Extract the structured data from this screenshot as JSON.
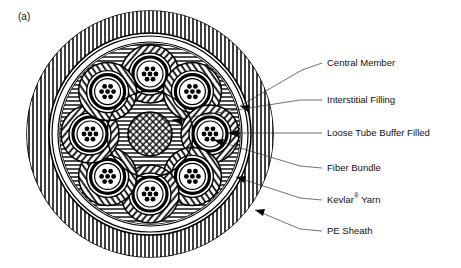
{
  "figure": {
    "tag": "(a)",
    "tag_x": 18,
    "tag_y": 17
  },
  "colors": {
    "line": "#000000",
    "leader": "#333333",
    "text": "#111111",
    "background": "#ffffff"
  },
  "cable": {
    "center_x": 150,
    "center_y": 134,
    "sheath_outer_r": 123,
    "sheath_inner_r": 101,
    "kevlar_outer_r": 98,
    "kevlar_inner_r": 92,
    "core_boundary_r": 90,
    "interstitial_r": 43,
    "central_member_r": 22,
    "tube_count": 8,
    "tube_orbit_r": 60,
    "tube_outer_r": 29,
    "tube_white_r": 21,
    "tube_black_r": 17,
    "bundle_r": 13,
    "fiber_dot_count": 7,
    "fiber_dot_r": 2.4,
    "fiber_ring_r": 6
  },
  "labels": [
    {
      "id": "central-member",
      "text": "Central Member",
      "text_x": 327,
      "text_y": 63,
      "leader": [
        [
          322,
          63
        ],
        [
          302,
          70
        ],
        [
          240,
          106
        ]
      ],
      "arrow_at": [
        240,
        106
      ],
      "arrow_angle": 150
    },
    {
      "id": "interstitial-filling",
      "text": "Interstitial Filling",
      "text_x": 327,
      "text_y": 100,
      "leader": [
        [
          322,
          100
        ],
        [
          300,
          100
        ],
        [
          172,
          120
        ]
      ],
      "arrow_at": [
        172,
        120
      ],
      "arrow_angle": 171
    },
    {
      "id": "loose-tube-buffer-filled",
      "text": "Loose Tube Buffer Filled",
      "text_x": 327,
      "text_y": 133,
      "leader": [
        [
          322,
          133
        ],
        [
          228,
          133
        ]
      ],
      "arrow_at": [
        228,
        133
      ],
      "arrow_angle": 180
    },
    {
      "id": "fiber-bundle",
      "text": "Fiber Bundle",
      "text_x": 327,
      "text_y": 168,
      "leader": [
        [
          322,
          168
        ],
        [
          300,
          166
        ],
        [
          214,
          140
        ]
      ],
      "arrow_at": [
        214,
        140
      ],
      "arrow_angle": 197
    },
    {
      "id": "kevlar-yarn",
      "text": "Kevlar",
      "text_sup": "®",
      "text_suffix": " Yarn",
      "text_x": 327,
      "text_y": 200,
      "leader": [
        [
          322,
          200
        ],
        [
          300,
          198
        ],
        [
          236,
          177
        ]
      ],
      "arrow_at": [
        236,
        177
      ],
      "arrow_angle": 198
    },
    {
      "id": "pe-sheath",
      "text": "PE Sheath",
      "text_x": 327,
      "text_y": 231,
      "leader": [
        [
          322,
          231
        ],
        [
          300,
          229
        ],
        [
          255,
          210
        ]
      ],
      "arrow_at": [
        255,
        210
      ],
      "arrow_angle": 203
    }
  ],
  "hatch": {
    "sheath_pattern": "vertical-lines",
    "interstitial_pattern": "horizontal-lines",
    "tube_pattern": "diagonal-lines",
    "central_member_pattern": "cross-hatch"
  }
}
